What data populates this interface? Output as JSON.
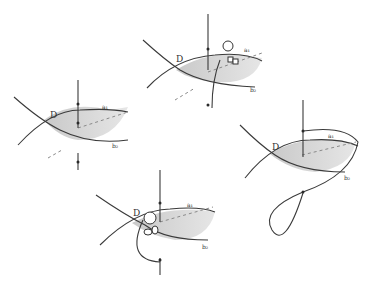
{
  "labels": {
    "disc": "D",
    "a": "a₁",
    "b": "b₂"
  },
  "panels": [
    {
      "id": "left",
      "description": "Shaded lens region D bounded by curves a1 and b2 with vertical line piercing it"
    },
    {
      "id": "top",
      "description": "Same configuration with a small figure climbing the region, line deflected"
    },
    {
      "id": "right",
      "description": "Line wraps around in a large loop around the region"
    },
    {
      "id": "bottom",
      "description": "Figure on region edge, line curving beneath"
    }
  ],
  "colors": {
    "shade": "#d9d9d9",
    "ink": "#3a3a3a"
  }
}
